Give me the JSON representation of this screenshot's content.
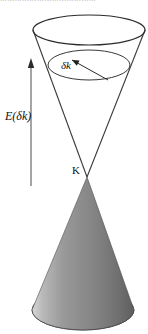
{
  "figure": {
    "name": "dirac-cone-diagram",
    "type": "physics-band-structure-cone",
    "header_fragment": "…………………………………",
    "labels": {
      "energy": "E(δk)",
      "delta_k": "δk",
      "dirac_point": "K"
    },
    "colors": {
      "stroke": "#2b2b2b",
      "cone_light": "#efefef",
      "cone_mid": "#8c8c8c",
      "cone_dark": "#4a4a4a",
      "background": "#ffffff",
      "header_text": "#9a9a9a"
    },
    "geometry": {
      "upper_rim_ellipse": {
        "cx": 89,
        "cy": 30,
        "rx": 56,
        "ry": 15
      },
      "inner_ellipse": {
        "cx": 89,
        "cy": 65,
        "rx": 41,
        "ry": 15
      },
      "apex": {
        "x": 87,
        "y": 177
      },
      "base_ellipse": {
        "cx": 83,
        "cy": 310,
        "rx": 51,
        "ry": 20
      },
      "energy_arrow": {
        "x": 31,
        "y_top": 60,
        "y_bottom": 186
      }
    }
  }
}
